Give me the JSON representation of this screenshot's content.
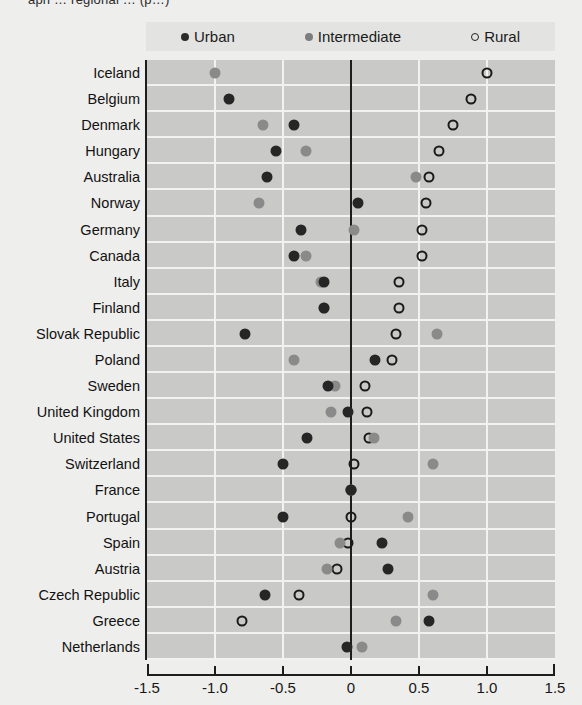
{
  "figure": {
    "partial_title": "aph … regional …  (p…)"
  },
  "legend": {
    "position": "top",
    "items": [
      {
        "label": "Urban",
        "marker": "filled-dark-circle",
        "color": "#2b2b2b",
        "icon": "urban-dot-icon"
      },
      {
        "label": "Intermediate",
        "marker": "filled-gray-circle",
        "color": "#7d7d7d",
        "icon": "intermediate-dot-icon"
      },
      {
        "label": "Rural",
        "marker": "open-circle",
        "color": "#232323",
        "icon": "rural-open-circle-icon"
      }
    ]
  },
  "axis": {
    "x_ticks": [
      "-1.5",
      "-1.0",
      "-0.5",
      "0",
      "0.5",
      "1.0",
      "1.5"
    ],
    "x_tick_values": [
      -1.5,
      -1.0,
      -0.5,
      0,
      0.5,
      1.0,
      1.5
    ],
    "xlim": [
      -1.5,
      1.5
    ],
    "zero_reference": 0
  },
  "chart_data": {
    "type": "scatter",
    "title": "",
    "subtitle": "",
    "xlabel": "",
    "ylabel": "",
    "xlim": [
      -1.5,
      1.5
    ],
    "grid": true,
    "orientation": "horizontal-dot-plot",
    "legend_position": "top",
    "series_names": [
      "Urban",
      "Intermediate",
      "Rural"
    ],
    "categories": [
      "Iceland",
      "Belgium",
      "Denmark",
      "Hungary",
      "Australia",
      "Norway",
      "Germany",
      "Canada",
      "Italy",
      "Finland",
      "Slovak Republic",
      "Poland",
      "Sweden",
      "United Kingdom",
      "United States",
      "Switzerland",
      "France",
      "Portugal",
      "Spain",
      "Austria",
      "Czech Republic",
      "Greece",
      "Netherlands"
    ],
    "series": [
      {
        "name": "Urban",
        "color": "#2b2b2b",
        "values": [
          null,
          -0.9,
          -0.42,
          -0.55,
          -0.62,
          0.05,
          -0.37,
          -0.42,
          -0.2,
          -0.2,
          -0.78,
          0.18,
          -0.17,
          -0.02,
          -0.32,
          -0.5,
          0.0,
          -0.5,
          0.23,
          0.27,
          -0.63,
          0.57,
          -0.03
        ]
      },
      {
        "name": "Intermediate",
        "color": "#8a8a8a",
        "values": [
          -1.0,
          null,
          -0.65,
          -0.33,
          0.48,
          -0.68,
          0.02,
          -0.33,
          -0.22,
          -0.2,
          0.63,
          -0.42,
          -0.12,
          -0.15,
          0.17,
          0.6,
          0.0,
          0.42,
          -0.08,
          -0.18,
          0.6,
          0.33,
          0.08
        ]
      },
      {
        "name": "Rural",
        "color": "#1a1a1a",
        "values": [
          1.0,
          0.88,
          0.75,
          0.65,
          0.57,
          0.55,
          0.52,
          0.52,
          0.35,
          0.35,
          0.33,
          0.3,
          0.1,
          0.12,
          0.13,
          0.02,
          0.0,
          0.0,
          -0.02,
          -0.1,
          -0.38,
          -0.8,
          null
        ]
      }
    ]
  }
}
